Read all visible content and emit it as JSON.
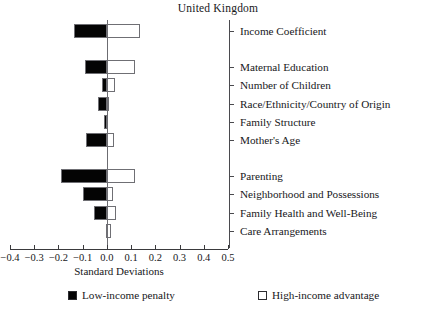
{
  "chart_data": {
    "type": "bar",
    "orientation": "horizontal",
    "title": "United Kingdom",
    "xlabel": "Standard Deviations",
    "ylabel": "",
    "xlim": [
      -0.4,
      0.5
    ],
    "xticks": [
      -0.4,
      -0.3,
      -0.2,
      -0.1,
      0.0,
      0.1,
      0.2,
      0.3,
      0.4,
      0.5
    ],
    "xtick_labels": [
      "−0.4",
      "−0.3",
      "−0.2",
      "−0.1",
      "0.0",
      "0.1",
      "0.2",
      "0.3",
      "0.4",
      "0.5"
    ],
    "grid": false,
    "legend_position": "bottom",
    "categories": [
      "Income Coefficient",
      "Maternal Education",
      "Number of Children",
      "Race/Ethnicity/Country of Origin",
      "Family Structure",
      "Mother's Age",
      "Parenting",
      "Neighborhood and Possessions",
      "Family Health and Well-Being",
      "Care Arrangements"
    ],
    "series": [
      {
        "name": "Low-income penalty",
        "color": "#040404",
        "values": [
          -0.135,
          -0.09,
          -0.022,
          -0.035,
          -0.012,
          -0.088,
          -0.19,
          -0.097,
          -0.053,
          -0.003
        ]
      },
      {
        "name": "High-income advantage",
        "color": "#ffffff",
        "values": [
          0.135,
          0.115,
          0.033,
          0.004,
          0.0,
          0.028,
          0.115,
          0.025,
          0.037,
          0.015
        ]
      }
    ],
    "row_gaps_after": [
      0,
      5
    ]
  },
  "legend": {
    "items": [
      {
        "label": "Low-income penalty",
        "swatch": "filled-square-icon"
      },
      {
        "label": "High-income advantage",
        "swatch": "hollow-square-icon"
      }
    ]
  }
}
